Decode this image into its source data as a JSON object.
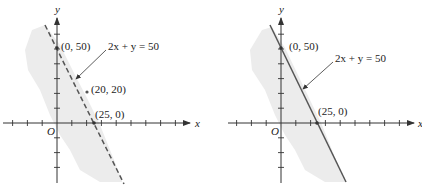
{
  "panels": [
    {
      "id": "left",
      "boundary_style": "dashed",
      "axis_x_label": "x",
      "axis_y_label": "y",
      "origin_label": "O",
      "equation_label": "2x + y = 50",
      "intercept_y_label": "(0, 50)",
      "intercept_x_label": "(25, 0)",
      "test_point_label": "(20, 20)",
      "test_point": [
        20,
        20
      ],
      "shaded_region": "below-left of line"
    },
    {
      "id": "right",
      "boundary_style": "solid",
      "axis_x_label": "x",
      "axis_y_label": "y",
      "origin_label": "O",
      "equation_label": "2x + y = 50",
      "intercept_y_label": "(0, 50)",
      "intercept_x_label": "(25, 0)",
      "shaded_region": "below-left of line"
    }
  ],
  "line": {
    "equation": "2x + y = 50",
    "x_intercept": [
      25,
      0
    ],
    "y_intercept": [
      0,
      50
    ]
  },
  "tick_step": 10,
  "colors": {
    "axis": "#333333",
    "line": "#555555",
    "shade": "#ececec",
    "point": "#555555"
  }
}
